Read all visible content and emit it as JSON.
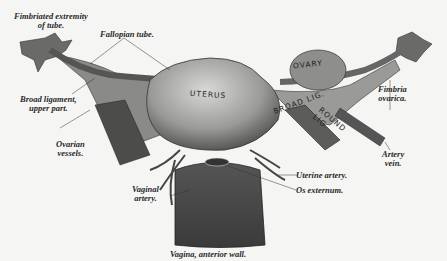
{
  "figure": {
    "labels": {
      "fimbriated": [
        "Fimbriated extremity",
        "of tube."
      ],
      "fallopian": "Fallopian tube.",
      "broad_upper": [
        "Broad ligament,",
        "upper part."
      ],
      "ovarian_vessels": [
        "Ovarian",
        "vessels."
      ],
      "fimbria_ovarica": [
        "Fimbria",
        "ovarica."
      ],
      "artery_vein": [
        "Artery",
        "vein."
      ],
      "uterine_artery": "Uterine artery.",
      "os_externum": "Os externum.",
      "vaginal_artery": [
        "Vaginal",
        "artery."
      ],
      "vagina_caption": "Vagina, anterior wall."
    },
    "organ_labels": {
      "uterus": "UTERUS",
      "ovary": "OVARY",
      "broad_lig": "BROAD LIG.",
      "round_lig": [
        "ROUND",
        "LIG."
      ]
    }
  }
}
